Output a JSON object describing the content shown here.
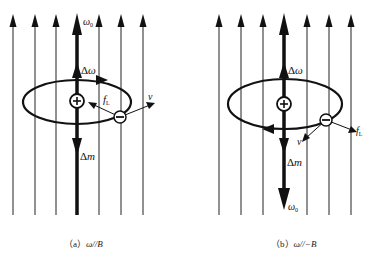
{
  "figure": {
    "panels": [
      {
        "id": "a",
        "caption_prefix": "（a）",
        "caption_math": "ω//B",
        "labels": {
          "omega0": "ω0",
          "delta_omega": "Δω",
          "force": "fL",
          "velocity": "v",
          "delta_m": "Δm",
          "nucleus": "+",
          "electron": "−"
        }
      },
      {
        "id": "b",
        "caption_prefix": "（b）",
        "caption_math": "ω//−B",
        "labels": {
          "omega0": "ω0",
          "delta_omega": "Δω",
          "force": "fL",
          "velocity": "v",
          "delta_m": "Δm",
          "nucleus": "+",
          "electron": "−"
        }
      }
    ],
    "colors": {
      "ink": "#111111",
      "background": "#ffffff"
    }
  }
}
